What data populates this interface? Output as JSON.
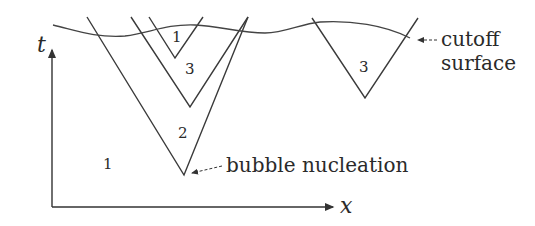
{
  "diagram": {
    "axes": {
      "x_label": "x",
      "t_label": "t"
    },
    "regions": [
      {
        "id": "outer",
        "label": "1"
      },
      {
        "id": "bubble-big",
        "label": "2"
      },
      {
        "id": "bubble-nested",
        "label": "3"
      },
      {
        "id": "bubble-inner",
        "label": "1"
      },
      {
        "id": "bubble-right",
        "label": "3"
      }
    ],
    "annotations": {
      "nucleation": "bubble nucleation",
      "cutoff_line1": "cutoff",
      "cutoff_line2": "surface"
    },
    "colors": {
      "line": "#3a3a3a",
      "background": "#ffffff"
    }
  }
}
